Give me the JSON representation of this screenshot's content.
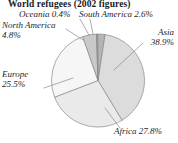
{
  "title": "World refugees (2002 figures)",
  "chart_data": {
    "type": "pie",
    "title": "World refugees (2002 figures)",
    "xlabel": "",
    "ylabel": "",
    "units": "percent",
    "legend_position": "callout-labels",
    "grid": false,
    "categories": [
      "Asia",
      "Africa",
      "Europe",
      "North America",
      "South America",
      "Oceania"
    ],
    "values": [
      38.9,
      27.8,
      25.5,
      4.8,
      2.6,
      0.4
    ],
    "slices": [
      {
        "name": "South America",
        "value": 2.6,
        "value_label": "2.6%",
        "color": "#b4b4b4"
      },
      {
        "name": "Asia",
        "value": 38.9,
        "value_label": "38.9%",
        "color": "#dcdcdc"
      },
      {
        "name": "Africa",
        "value": 27.8,
        "value_label": "27.8%",
        "color": "#eaeaea"
      },
      {
        "name": "Europe",
        "value": 25.5,
        "value_label": "25.5%",
        "color": "#f6f6f6"
      },
      {
        "name": "North America",
        "value": 4.8,
        "value_label": "4.8%",
        "color": "#c9c9c9"
      },
      {
        "name": "Oceania",
        "value": 0.4,
        "value_label": "0.4%",
        "color": "#9e9e9e"
      }
    ]
  },
  "labels": {
    "oceania": {
      "line1": "Oceania 0.4%"
    },
    "south_america": {
      "line1": "South America 2.6%"
    },
    "north_america": {
      "line1": "North America",
      "line2": "4.8%"
    },
    "asia": {
      "line1": "Asia",
      "line2": "38.9%"
    },
    "europe": {
      "line1": "Europe",
      "line2": "25.5%"
    },
    "africa": {
      "line1": "Africa 27.8%"
    }
  },
  "colors": {
    "outline": "#8a8a8a",
    "leader": "#8a8a8a",
    "text": "#262626",
    "title": "#1a1a1a",
    "background": "#ffffff"
  }
}
